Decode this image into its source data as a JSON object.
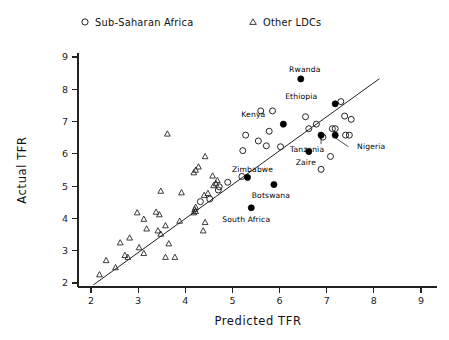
{
  "chart_data": {
    "type": "scatter",
    "title": "",
    "xlabel": "Predicted TFR",
    "ylabel": "Actual TFR",
    "xlim": [
      1.6,
      9.4
    ],
    "ylim": [
      1.65,
      9.4
    ],
    "xticks": [
      2,
      3,
      4,
      5,
      6,
      7,
      8,
      9
    ],
    "yticks": [
      2,
      3,
      4,
      5,
      6,
      7,
      8,
      9
    ],
    "grid": false,
    "legend_position": "top",
    "legend": [
      {
        "label": "Sub-Saharan Africa",
        "marker": "circle-open"
      },
      {
        "label": "Other LDCs",
        "marker": "triangle-open"
      }
    ],
    "reference_line": {
      "description": "45-degree identity line",
      "x0": 2.05,
      "y0": 1.94,
      "x1": 8.12,
      "y1": 8.33
    },
    "series": [
      {
        "name": "Sub-Saharan Africa",
        "marker": "circle-open",
        "points": [
          {
            "x": 5.6,
            "y": 7.33
          },
          {
            "x": 5.85,
            "y": 7.33
          },
          {
            "x": 6.55,
            "y": 7.15
          },
          {
            "x": 7.3,
            "y": 7.62
          },
          {
            "x": 7.38,
            "y": 7.17
          },
          {
            "x": 7.52,
            "y": 7.07
          },
          {
            "x": 6.78,
            "y": 6.92
          },
          {
            "x": 6.62,
            "y": 6.78
          },
          {
            "x": 5.78,
            "y": 6.7
          },
          {
            "x": 5.28,
            "y": 6.58
          },
          {
            "x": 5.55,
            "y": 6.4
          },
          {
            "x": 7.12,
            "y": 6.78
          },
          {
            "x": 7.18,
            "y": 6.78
          },
          {
            "x": 7.4,
            "y": 6.58
          },
          {
            "x": 7.48,
            "y": 6.58
          },
          {
            "x": 6.92,
            "y": 6.52
          },
          {
            "x": 6.02,
            "y": 6.22
          },
          {
            "x": 5.72,
            "y": 6.25
          },
          {
            "x": 5.22,
            "y": 6.1
          },
          {
            "x": 7.08,
            "y": 5.92
          },
          {
            "x": 6.88,
            "y": 5.52
          },
          {
            "x": 5.2,
            "y": 5.3
          },
          {
            "x": 4.9,
            "y": 5.12
          },
          {
            "x": 4.72,
            "y": 4.98
          },
          {
            "x": 4.7,
            "y": 4.88
          },
          {
            "x": 4.52,
            "y": 4.6
          },
          {
            "x": 4.32,
            "y": 4.52
          }
        ]
      },
      {
        "name": "Other LDCs",
        "marker": "triangle-open",
        "points": [
          {
            "x": 3.62,
            "y": 6.62
          },
          {
            "x": 4.42,
            "y": 5.92
          },
          {
            "x": 4.28,
            "y": 5.6
          },
          {
            "x": 4.22,
            "y": 5.5
          },
          {
            "x": 4.58,
            "y": 5.32
          },
          {
            "x": 4.18,
            "y": 5.42
          },
          {
            "x": 4.68,
            "y": 5.18
          },
          {
            "x": 4.65,
            "y": 5.08
          },
          {
            "x": 4.6,
            "y": 5.02
          },
          {
            "x": 3.48,
            "y": 4.85
          },
          {
            "x": 3.92,
            "y": 4.8
          },
          {
            "x": 4.48,
            "y": 4.78
          },
          {
            "x": 4.4,
            "y": 4.72
          },
          {
            "x": 4.22,
            "y": 4.35
          },
          {
            "x": 4.2,
            "y": 4.28
          },
          {
            "x": 4.22,
            "y": 4.22
          },
          {
            "x": 4.18,
            "y": 4.18
          },
          {
            "x": 2.98,
            "y": 4.18
          },
          {
            "x": 3.38,
            "y": 4.2
          },
          {
            "x": 3.45,
            "y": 4.12
          },
          {
            "x": 3.12,
            "y": 3.98
          },
          {
            "x": 3.88,
            "y": 3.92
          },
          {
            "x": 4.42,
            "y": 3.88
          },
          {
            "x": 3.58,
            "y": 3.78
          },
          {
            "x": 3.42,
            "y": 3.62
          },
          {
            "x": 4.38,
            "y": 3.62
          },
          {
            "x": 3.18,
            "y": 3.68
          },
          {
            "x": 3.48,
            "y": 3.52
          },
          {
            "x": 2.82,
            "y": 3.4
          },
          {
            "x": 3.65,
            "y": 3.22
          },
          {
            "x": 2.62,
            "y": 3.25
          },
          {
            "x": 3.02,
            "y": 3.1
          },
          {
            "x": 3.12,
            "y": 2.92
          },
          {
            "x": 2.72,
            "y": 2.86
          },
          {
            "x": 2.78,
            "y": 2.8
          },
          {
            "x": 3.58,
            "y": 2.8
          },
          {
            "x": 3.78,
            "y": 2.8
          },
          {
            "x": 2.32,
            "y": 2.7
          },
          {
            "x": 2.52,
            "y": 2.48
          },
          {
            "x": 2.18,
            "y": 2.26
          }
        ]
      },
      {
        "name": "Labeled countries",
        "marker": "circle-filled",
        "points": [
          {
            "x": 6.45,
            "y": 8.32,
            "label": "Rwanda",
            "label_dx": 4,
            "label_dy": -7
          },
          {
            "x": 7.18,
            "y": 7.55,
            "label": "Ethiopia",
            "label_dx": -34,
            "label_dy": -5
          },
          {
            "x": 6.08,
            "y": 6.92,
            "label": "Kenya",
            "label_dx": -30,
            "label_dy": -7
          },
          {
            "x": 6.88,
            "y": 6.58,
            "label": "Tanzania",
            "label_dx": -14,
            "label_dy": 17
          },
          {
            "x": 7.18,
            "y": 6.58,
            "label": "Nigeria",
            "label_dx": 36,
            "label_dy": 14
          },
          {
            "x": 6.62,
            "y": 6.07,
            "label": "Zaire",
            "label_dx": -3,
            "label_dy": 13
          },
          {
            "x": 5.32,
            "y": 5.27,
            "label": "Zimbabwe",
            "label_dx": 5,
            "label_dy": -5
          },
          {
            "x": 5.88,
            "y": 5.05,
            "label": "Botswana",
            "label_dx": -3,
            "label_dy": 13
          },
          {
            "x": 5.4,
            "y": 4.33,
            "label": "South Africa",
            "label_dx": -5,
            "label_dy": 14
          }
        ]
      }
    ],
    "leader_lines": [
      {
        "x0": 7.18,
        "y0": 6.5,
        "x1": 7.46,
        "y1": 6.22,
        "for": "Nigeria"
      },
      {
        "x0": 6.88,
        "y0": 6.5,
        "x1": 6.88,
        "y1": 6.3,
        "for": "Tanzania"
      }
    ]
  },
  "axes": {
    "x_title": "Predicted TFR",
    "y_title": "Actual TFR",
    "x_tick_labels": [
      "2",
      "3",
      "4",
      "5",
      "6",
      "7",
      "8",
      "9"
    ],
    "y_tick_labels": [
      "2",
      "3",
      "4",
      "5",
      "6",
      "7",
      "8",
      "9"
    ]
  },
  "legend": {
    "items": [
      {
        "label": "Sub-Saharan Africa",
        "icon": "circle-open-icon"
      },
      {
        "label": "Other LDCs",
        "icon": "triangle-open-icon"
      }
    ]
  },
  "colors": {
    "ink": "#1a1a1a",
    "background": "#ffffff",
    "marker_fill": "#000000"
  }
}
